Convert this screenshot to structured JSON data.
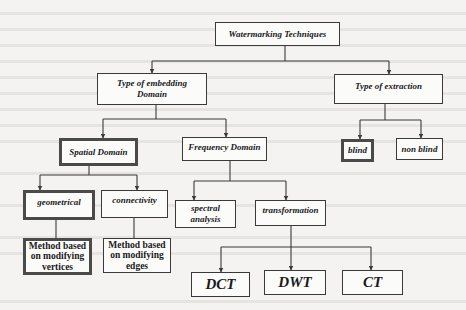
{
  "diagram": {
    "title": "Watermarking Techniques",
    "nodes": {
      "root": "Watermarking Techniques",
      "embedding": "Type of embedding Domain",
      "extraction": "Type of extraction",
      "spatial": "Spatial Domain",
      "frequency": "Frequency Domain",
      "blind": "blind",
      "non_blind": "non blind",
      "geometrical": "geometrical",
      "connectivity": "connectivity",
      "spectral": "spectral analysis",
      "transformation": "transformation",
      "method_vertices": "Method based on modifying vertices",
      "method_edges": "Method based on modifying edges",
      "dct": "DCT",
      "dwt": "DWT",
      "ct": "CT"
    },
    "edges": [
      [
        "root",
        "embedding"
      ],
      [
        "root",
        "extraction"
      ],
      [
        "embedding",
        "spatial"
      ],
      [
        "embedding",
        "frequency"
      ],
      [
        "extraction",
        "blind"
      ],
      [
        "extraction",
        "non_blind"
      ],
      [
        "spatial",
        "geometrical"
      ],
      [
        "spatial",
        "connectivity"
      ],
      [
        "frequency",
        "spectral"
      ],
      [
        "frequency",
        "transformation"
      ],
      [
        "geometrical",
        "method_vertices"
      ],
      [
        "connectivity",
        "method_edges"
      ],
      [
        "transformation",
        "dct"
      ],
      [
        "transformation",
        "dwt"
      ],
      [
        "transformation",
        "ct"
      ]
    ],
    "colors": {
      "line": "#3a3a3a",
      "background": "#f4f3f1",
      "box_fill": "#fbfbfa"
    }
  }
}
